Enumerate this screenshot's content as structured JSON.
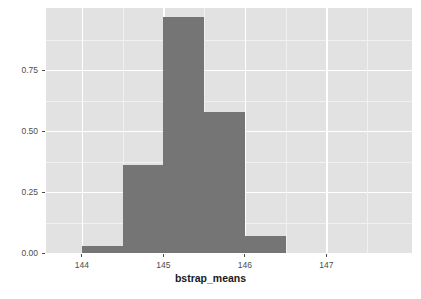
{
  "chart_data": {
    "type": "bar",
    "title": "",
    "subtitle": "",
    "xlabel": "bstrap_means",
    "ylabel": "density",
    "xlim": [
      143.56,
      148.05
    ],
    "ylim": [
      0.0,
      1.005
    ],
    "grid": true,
    "legend": null,
    "bin_width": 0.5,
    "categories": [
      "144.0-144.5",
      "144.5-145.0",
      "145.0-145.5",
      "145.5-146.0",
      "146.0-146.5"
    ],
    "bin_edges": [
      144.0,
      144.5,
      145.0,
      145.5,
      146.0,
      146.5
    ],
    "values": [
      0.03,
      0.36,
      0.97,
      0.58,
      0.07
    ],
    "x": [
      144.25,
      144.75,
      145.25,
      145.75,
      146.25
    ],
    "xticks": [
      144,
      145,
      146,
      147
    ],
    "xtick_labels": [
      "144",
      "145",
      "146",
      "147"
    ],
    "yticks": [
      0.0,
      0.25,
      0.5,
      0.75
    ],
    "ytick_labels": [
      "0.00",
      "0.25",
      "0.50",
      "0.75"
    ],
    "x_minor_ticks": [
      143.5,
      144.5,
      145.5,
      146.5,
      147.5
    ],
    "y_minor_ticks": [
      0.125,
      0.375,
      0.625,
      0.875
    ],
    "colors": {
      "bar_fill": "#757575",
      "panel_background": "#e2e2e2",
      "figure_background": "#ffffff",
      "major_gridline": "#ffffff",
      "minor_gridline": "#f1f1f1",
      "axis_text": "#4d4d4d",
      "axis_title": "#1a1a1a"
    }
  }
}
